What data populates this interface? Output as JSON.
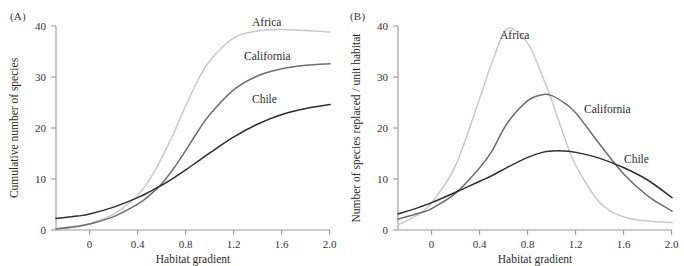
{
  "figure": {
    "panels": [
      {
        "tag": "(A)",
        "xlabel": "Habitat gradient",
        "ylabel": "Cumulative number of species"
      },
      {
        "tag": "(B)",
        "xlabel": "Habitat gradient",
        "ylabel": "Number of species replaced / unit habitat"
      }
    ]
  },
  "series_labels": {
    "africa": "Africa",
    "california": "California",
    "chile": "Chile"
  },
  "colors": {
    "africa": "#c9c9c9",
    "california": "#6e6e6e",
    "chile": "#2e2e2e",
    "axis": "#9a9a9a",
    "text": "#2b2b2b",
    "background": "#ffffff"
  },
  "chart_data": [
    {
      "type": "line",
      "panel": "(A)",
      "title": "",
      "xlabel": "Habitat gradient",
      "ylabel": "Cumulative number of species",
      "xlim": [
        -0.28,
        2.0
      ],
      "ylim": [
        0,
        41
      ],
      "xticks": [
        0,
        0.4,
        0.8,
        1.2,
        1.6,
        2.0
      ],
      "xtick_labels": [
        "0",
        "0.4",
        "0.8",
        "1.2",
        "1.6",
        "2.0"
      ],
      "yticks": [
        0,
        10,
        20,
        30,
        40
      ],
      "ytick_labels": [
        "0",
        "10",
        "20",
        "30",
        "40"
      ],
      "grid": false,
      "legend": "inline-curve-labels",
      "x": [
        -0.28,
        -0.1,
        0.0,
        0.2,
        0.4,
        0.5,
        0.6,
        0.7,
        0.8,
        0.9,
        1.0,
        1.2,
        1.4,
        1.6,
        1.8,
        2.0
      ],
      "series": [
        {
          "name": "Africa",
          "color": "#c9c9c9",
          "values": [
            0.3,
            0.8,
            1.3,
            3.2,
            7.0,
            10.2,
            14.5,
            19.5,
            25.0,
            30.0,
            34.0,
            38.6,
            40.0,
            40.3,
            40.1,
            39.8
          ],
          "asymptote": 40,
          "label_at": {
            "x": 1.62,
            "y": 41.5
          }
        },
        {
          "name": "California",
          "color": "#6e6e6e",
          "values": [
            0.2,
            0.7,
            1.2,
            2.7,
            5.2,
            7.0,
            9.3,
            12.4,
            16.0,
            19.8,
            23.2,
            28.2,
            31.0,
            32.4,
            33.1,
            33.4
          ],
          "asymptote": 33,
          "label_at": {
            "x": 1.44,
            "y": 35.4
          }
        },
        {
          "name": "Chile",
          "color": "#2e2e2e",
          "values": [
            2.3,
            2.8,
            3.2,
            4.6,
            6.5,
            7.7,
            9.0,
            10.5,
            12.1,
            13.8,
            15.5,
            18.7,
            21.3,
            23.2,
            24.4,
            25.2
          ],
          "asymptote": 25,
          "label_at": {
            "x": 1.36,
            "y": 27.3
          }
        }
      ]
    },
    {
      "type": "line",
      "panel": "(B)",
      "title": "",
      "xlabel": "Habitat gradient",
      "ylabel": "Number of species replaced / unit habitat",
      "xlim": [
        -0.28,
        2.0
      ],
      "ylim": [
        0,
        41
      ],
      "xticks": [
        0,
        0.4,
        0.8,
        1.2,
        1.6,
        2.0
      ],
      "xtick_labels": [
        "0",
        "0.4",
        "0.8",
        "1.2",
        "1.6",
        "2.0"
      ],
      "yticks": [
        0,
        10,
        20,
        30,
        40
      ],
      "ytick_labels": [
        "0",
        "10",
        "20",
        "30",
        "40"
      ],
      "grid": false,
      "legend": "inline-curve-labels",
      "x": [
        -0.28,
        -0.1,
        0.0,
        0.2,
        0.4,
        0.5,
        0.63,
        0.8,
        0.92,
        1.0,
        1.1,
        1.2,
        1.4,
        1.6,
        1.8,
        2.0
      ],
      "series": [
        {
          "name": "Africa",
          "color": "#c9c9c9",
          "values": [
            1.0,
            3.3,
            5.5,
            13.0,
            26.5,
            33.5,
            40.5,
            37.5,
            31.0,
            26.0,
            19.0,
            13.0,
            5.5,
            2.6,
            1.8,
            1.5
          ],
          "peak": {
            "x": 0.63,
            "y": 40.5
          },
          "label_at": {
            "x": 0.78,
            "y": 38.5
          }
        },
        {
          "name": "California",
          "color": "#6e6e6e",
          "values": [
            2.2,
            3.4,
            4.3,
            7.4,
            12.5,
            15.8,
            21.5,
            26.0,
            27.2,
            27.0,
            25.6,
            23.5,
            17.2,
            11.2,
            6.8,
            3.8
          ],
          "peak": {
            "x": 0.92,
            "y": 27.2
          },
          "label_at": {
            "x": 1.42,
            "y": 21.5
          }
        },
        {
          "name": "Chile",
          "color": "#2e2e2e",
          "values": [
            3.2,
            4.6,
            5.5,
            7.6,
            9.8,
            10.9,
            12.6,
            14.6,
            15.6,
            15.9,
            15.9,
            15.6,
            14.4,
            12.5,
            10.0,
            6.5
          ],
          "peak": {
            "x": 1.02,
            "y": 16.0
          },
          "label_at": {
            "x": 1.67,
            "y": 12.6
          }
        }
      ]
    }
  ]
}
